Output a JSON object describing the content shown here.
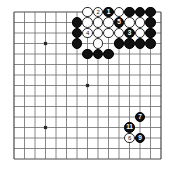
{
  "board": {
    "title": "Go board diagram",
    "size": 15,
    "origin_x": 14,
    "origin_y": 12,
    "spacing": 10.5,
    "stone_radius": 5.2,
    "line_color": "#6b6b6b",
    "edge_color": "#4a4a4a",
    "black_color": "#111111",
    "white_color": "#ffffff",
    "background": "#ffffff",
    "star_points": [
      {
        "col": 3,
        "row": 3
      },
      {
        "col": 11,
        "row": 3
      },
      {
        "col": 7,
        "row": 7
      },
      {
        "col": 3,
        "row": 11
      },
      {
        "col": 11,
        "row": 11
      }
    ]
  },
  "stones": [
    {
      "col": 7,
      "row": 0,
      "color": "white",
      "label": ""
    },
    {
      "col": 8,
      "row": 0,
      "color": "white",
      "label": "2"
    },
    {
      "col": 9,
      "row": 0,
      "color": "black",
      "label": "1"
    },
    {
      "col": 10,
      "row": 0,
      "color": "white",
      "label": ""
    },
    {
      "col": 11,
      "row": 0,
      "color": "black",
      "label": ""
    },
    {
      "col": 12,
      "row": 0,
      "color": "black",
      "label": ""
    },
    {
      "col": 13,
      "row": 0,
      "color": "black",
      "label": ""
    },
    {
      "col": 6,
      "row": 1,
      "color": "black",
      "label": ""
    },
    {
      "col": 7,
      "row": 1,
      "color": "white",
      "label": ""
    },
    {
      "col": 8,
      "row": 1,
      "color": "white",
      "label": ""
    },
    {
      "col": 9,
      "row": 1,
      "color": "white",
      "label": ""
    },
    {
      "col": 10,
      "row": 1,
      "color": "black",
      "label": "5"
    },
    {
      "col": 11,
      "row": 1,
      "color": "white",
      "label": ""
    },
    {
      "col": 12,
      "row": 1,
      "color": "white",
      "label": ""
    },
    {
      "col": 13,
      "row": 1,
      "color": "black",
      "label": ""
    },
    {
      "col": 6,
      "row": 2,
      "color": "black",
      "label": ""
    },
    {
      "col": 7,
      "row": 2,
      "color": "white",
      "label": "4"
    },
    {
      "col": 8,
      "row": 2,
      "color": "white",
      "label": ""
    },
    {
      "col": 9,
      "row": 2,
      "color": "white",
      "label": ""
    },
    {
      "col": 10,
      "row": 2,
      "color": "white",
      "label": ""
    },
    {
      "col": 11,
      "row": 2,
      "color": "black",
      "label": "3"
    },
    {
      "col": 12,
      "row": 2,
      "color": "white",
      "label": ""
    },
    {
      "col": 13,
      "row": 2,
      "color": "black",
      "label": ""
    },
    {
      "col": 6,
      "row": 3,
      "color": "black",
      "label": ""
    },
    {
      "col": 8,
      "row": 3,
      "color": "white",
      "label": ""
    },
    {
      "col": 10,
      "row": 3,
      "color": "black",
      "label": ""
    },
    {
      "col": 11,
      "row": 3,
      "color": "black",
      "label": ""
    },
    {
      "col": 12,
      "row": 3,
      "color": "black",
      "label": ""
    },
    {
      "col": 13,
      "row": 3,
      "color": "black",
      "label": ""
    },
    {
      "col": 7,
      "row": 4,
      "color": "black",
      "label": ""
    },
    {
      "col": 8,
      "row": 4,
      "color": "black",
      "label": ""
    },
    {
      "col": 9,
      "row": 4,
      "color": "black",
      "label": ""
    },
    {
      "col": 12,
      "row": 10,
      "color": "black",
      "label": "7"
    },
    {
      "col": 11,
      "row": 11,
      "color": "black",
      "label": "11"
    },
    {
      "col": 11,
      "row": 12,
      "color": "white",
      "label": "6"
    },
    {
      "col": 12,
      "row": 12,
      "color": "black",
      "label": "9"
    }
  ]
}
